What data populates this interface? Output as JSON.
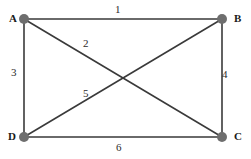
{
  "figure": {
    "width": 251,
    "height": 159,
    "background": "#ffffff",
    "type": "undirected-graph"
  },
  "style": {
    "vertex_color": "#6e6e6e",
    "vertex_radius": 5,
    "edge_color": "#3a3a3a",
    "edge_width": 1.6,
    "label_color": "#1a1a1a",
    "edge_label_color": "#2b2b2b"
  },
  "chart_data": {
    "type": "diagram",
    "title": "",
    "nodes": [
      {
        "id": "A",
        "label": "A",
        "x": 24,
        "y": 19,
        "label_x": 9,
        "label_y": 13
      },
      {
        "id": "B",
        "label": "B",
        "x": 222,
        "y": 19,
        "label_x": 234,
        "label_y": 13
      },
      {
        "id": "C",
        "label": "C",
        "x": 222,
        "y": 137,
        "label_x": 234,
        "label_y": 131
      },
      {
        "id": "D",
        "label": "D",
        "x": 24,
        "y": 137,
        "label_x": 8,
        "label_y": 131
      }
    ],
    "edges": [
      {
        "label": "1",
        "from": "A",
        "to": "B",
        "label_x": 115,
        "label_y": 4
      },
      {
        "label": "2",
        "from": "A",
        "to": "C",
        "label_x": 83,
        "label_y": 38
      },
      {
        "label": "3",
        "from": "A",
        "to": "D",
        "label_x": 11,
        "label_y": 67
      },
      {
        "label": "4",
        "from": "B",
        "to": "C",
        "label_x": 222,
        "label_y": 69
      },
      {
        "label": "5",
        "from": "D",
        "to": "B",
        "label_x": 83,
        "label_y": 88
      },
      {
        "label": "6",
        "from": "D",
        "to": "C",
        "label_x": 116,
        "label_y": 142
      }
    ]
  }
}
